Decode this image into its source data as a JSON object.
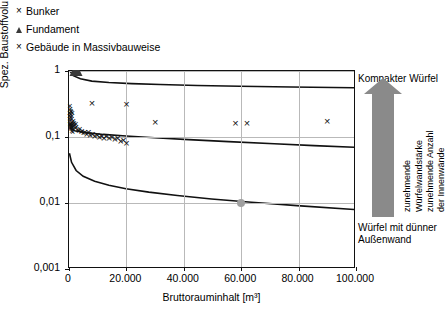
{
  "legend": {
    "items": [
      {
        "marker": "x-cross",
        "label": "Bunker"
      },
      {
        "marker": "triangle",
        "label": "Fundament"
      },
      {
        "marker": "x-cross",
        "label": "Gebäude in Massivbauweise"
      }
    ]
  },
  "annotations": {
    "top": "Kompakter Würfel",
    "bottom": "Würfel mit dünner Außenwand",
    "vertical_1": "zunehmende",
    "vertical_2": "Würfelwandstärke",
    "vertical_3": "zunehmende Anzahl",
    "vertical_4": "der Innenwände",
    "arrow_color": "#8a8a8a"
  },
  "chart_data": {
    "type": "scatter",
    "title": "",
    "xlabel": "Bruttorauminhalt [m³]",
    "ylabel": "Spez. Baustoffvolumen [m³/m³ BRI]",
    "xlim": [
      0,
      100000
    ],
    "ylim": [
      0.001,
      1
    ],
    "yscale": "log",
    "xscale": "linear",
    "grid": true,
    "legend_position": "top-left-outside",
    "xticks": [
      0,
      20000,
      40000,
      60000,
      80000,
      100000
    ],
    "xticklabels": [
      "0",
      "20.000",
      "40.000",
      "60.000",
      "80.000",
      "100.000"
    ],
    "yticks": [
      0.001,
      0.01,
      0.1,
      1
    ],
    "yticklabels": [
      "0,001",
      "0,01",
      "0,1",
      "1"
    ],
    "series": [
      {
        "name": "Gebäude in Massivbauweise",
        "marker": "x-cross",
        "points": [
          [
            300,
            0.3
          ],
          [
            500,
            0.27
          ],
          [
            450,
            0.22
          ],
          [
            700,
            0.25
          ],
          [
            600,
            0.2
          ],
          [
            800,
            0.24
          ],
          [
            900,
            0.19
          ],
          [
            1000,
            0.21
          ],
          [
            1100,
            0.17
          ],
          [
            1200,
            0.23
          ],
          [
            400,
            0.16
          ],
          [
            350,
            0.185
          ],
          [
            1300,
            0.155
          ],
          [
            1500,
            0.175
          ],
          [
            1600,
            0.145
          ],
          [
            1800,
            0.165
          ],
          [
            2000,
            0.15
          ],
          [
            2200,
            0.135
          ],
          [
            2400,
            0.155
          ],
          [
            2600,
            0.14
          ],
          [
            250,
            0.235
          ],
          [
            550,
            0.145
          ],
          [
            650,
            0.135
          ],
          [
            750,
            0.155
          ],
          [
            850,
            0.13
          ],
          [
            950,
            0.145
          ],
          [
            1050,
            0.125
          ],
          [
            1150,
            0.14
          ],
          [
            1250,
            0.12
          ],
          [
            1400,
            0.132
          ],
          [
            200,
            0.21
          ],
          [
            300,
            0.175
          ],
          [
            420,
            0.16
          ],
          [
            520,
            0.15
          ],
          [
            620,
            0.142
          ],
          [
            3000,
            0.128
          ],
          [
            3400,
            0.122
          ],
          [
            3800,
            0.13
          ],
          [
            4200,
            0.118
          ],
          [
            4600,
            0.125
          ],
          [
            5000,
            0.115
          ],
          [
            5600,
            0.12
          ],
          [
            6200,
            0.112
          ],
          [
            6800,
            0.118
          ],
          [
            7400,
            0.108
          ],
          [
            8200,
            0.112
          ],
          [
            9000,
            0.105
          ],
          [
            9800,
            0.108
          ],
          [
            10600,
            0.1
          ],
          [
            11400,
            0.104
          ],
          [
            12200,
            0.098
          ],
          [
            13000,
            0.102
          ],
          [
            14000,
            0.096
          ],
          [
            15000,
            0.1
          ],
          [
            16000,
            0.092
          ],
          [
            17000,
            0.095
          ],
          [
            18000,
            0.088
          ],
          [
            19000,
            0.091
          ],
          [
            20000,
            0.082
          ],
          [
            8000,
            0.33
          ],
          [
            20000,
            0.315
          ],
          [
            30000,
            0.17
          ],
          [
            58000,
            0.165
          ],
          [
            62000,
            0.165
          ],
          [
            90000,
            0.175
          ]
        ]
      },
      {
        "name": "Fundament",
        "marker": "triangle",
        "points": [
          [
            2500,
            0.93
          ]
        ]
      },
      {
        "name": "Bunker",
        "marker": "dot-gray",
        "points": [
          [
            60000,
            0.01
          ]
        ]
      }
    ],
    "curves": [
      {
        "name": "kompakter-wuerfel-oben",
        "points": [
          [
            200,
            1.02
          ],
          [
            1500,
            0.85
          ],
          [
            4000,
            0.76
          ],
          [
            8000,
            0.7
          ],
          [
            14000,
            0.665
          ],
          [
            22000,
            0.64
          ],
          [
            32000,
            0.62
          ],
          [
            45000,
            0.6
          ],
          [
            60000,
            0.585
          ],
          [
            78000,
            0.57
          ],
          [
            100000,
            0.555
          ]
        ]
      },
      {
        "name": "mittlere-kurve",
        "points": [
          [
            200,
            0.135
          ],
          [
            2000,
            0.122
          ],
          [
            6000,
            0.114
          ],
          [
            12000,
            0.107
          ],
          [
            20000,
            0.101
          ],
          [
            30000,
            0.095
          ],
          [
            42000,
            0.089
          ],
          [
            56000,
            0.083
          ],
          [
            72000,
            0.077
          ],
          [
            86000,
            0.072
          ],
          [
            100000,
            0.068
          ]
        ]
      },
      {
        "name": "wuerfel-duenne-aussenwand-unten",
        "points": [
          [
            150,
            0.055
          ],
          [
            900,
            0.04
          ],
          [
            2500,
            0.03
          ],
          [
            5000,
            0.0245
          ],
          [
            9000,
            0.0205
          ],
          [
            14000,
            0.0178
          ],
          [
            20000,
            0.0158
          ],
          [
            28000,
            0.014
          ],
          [
            38000,
            0.0124
          ],
          [
            50000,
            0.011
          ],
          [
            64000,
            0.0098
          ],
          [
            80000,
            0.0087
          ],
          [
            100000,
            0.0076
          ]
        ]
      }
    ]
  }
}
